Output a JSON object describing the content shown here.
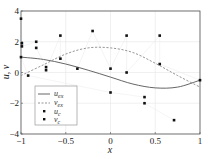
{
  "chart_data": {
    "type": "scatter",
    "title": "",
    "xlabel": "x",
    "ylabel": "u, v",
    "xlim": [
      -1,
      1
    ],
    "ylim": [
      -4,
      4
    ],
    "xticks": [
      "-1",
      "-0.5",
      "0",
      "0.5",
      "1"
    ],
    "yticks": [
      "-4",
      "-2",
      "0",
      "2",
      "4"
    ],
    "grid": true,
    "legend_position": "lower left",
    "legend": [
      "u_ex",
      "v_ex",
      "u_c",
      "v_c"
    ],
    "series": [
      {
        "name": "u_ex",
        "style": "solid-line",
        "x": [
          -1,
          -0.75,
          -0.5,
          -0.25,
          0,
          0.25,
          0.5,
          0.75,
          1
        ],
        "y": [
          1.0,
          0.85,
          0.55,
          0.15,
          -0.3,
          -0.75,
          -1.0,
          -0.95,
          -0.5
        ]
      },
      {
        "name": "v_ex",
        "style": "dashed-line",
        "x": [
          -1,
          -0.75,
          -0.5,
          -0.25,
          0,
          0.25,
          0.5,
          0.75,
          1
        ],
        "y": [
          -0.2,
          0.5,
          1.2,
          1.6,
          1.6,
          1.3,
          0.6,
          -0.2,
          -0.95
        ]
      },
      {
        "name": "u_c",
        "style": "markers",
        "x": [
          -1,
          -0.99,
          -0.99,
          -0.83,
          -0.83,
          -0.56,
          -0.56,
          -0.2,
          0.18,
          0.55,
          -0.72,
          -0.72,
          -0.37,
          0.0,
          0.18,
          0.55,
          1.0
        ],
        "y": [
          3.5,
          1.9,
          1.7,
          2.0,
          1.6,
          2.4,
          0.9,
          2.7,
          2.4,
          2.4,
          0.35,
          0.15,
          0.25,
          0.25,
          0.0,
          0.55,
          -0.5
        ]
      },
      {
        "name": "v_c",
        "style": "markers",
        "x": [
          -1,
          -0.92,
          0.0,
          0.38,
          0.38,
          0.71
        ],
        "y": [
          1.0,
          -0.2,
          -1.3,
          -1.6,
          -2.0,
          -3.1
        ]
      }
    ]
  },
  "legend_labels": {
    "u_ex": "u",
    "u_ex_sub": "ex",
    "v_ex": "v",
    "v_ex_sub": "ex",
    "u_c": "u",
    "u_c_sub": "c",
    "v_c": "v",
    "v_c_sub": "c"
  },
  "axis_labels": {
    "x": "x",
    "y": "u, v"
  }
}
